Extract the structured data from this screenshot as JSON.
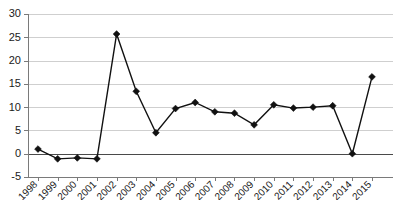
{
  "chart_data": {
    "type": "line",
    "title": "",
    "xlabel": "",
    "ylabel": "",
    "categories": [
      "1998",
      "1999",
      "2000",
      "2001",
      "2002",
      "2003",
      "2004",
      "2005",
      "2006",
      "2007",
      "2008",
      "2009",
      "2010",
      "2011",
      "2012",
      "2013",
      "2014",
      "2015"
    ],
    "values": [
      1.0,
      -1.1,
      -0.9,
      -1.1,
      25.7,
      13.4,
      4.5,
      9.7,
      11.0,
      9.0,
      8.7,
      6.2,
      10.5,
      9.8,
      10.0,
      10.3,
      0.0,
      16.5
    ],
    "series": [
      {
        "name": "series-1",
        "values": [
          1.0,
          -1.1,
          -0.9,
          -1.1,
          25.7,
          13.4,
          4.5,
          9.7,
          11.0,
          9.0,
          8.7,
          6.2,
          10.5,
          9.8,
          10.0,
          10.3,
          0.0,
          16.5
        ]
      }
    ],
    "ylim": [
      -5,
      30
    ],
    "yticks": [
      -5,
      0,
      5,
      10,
      15,
      20,
      25,
      30
    ],
    "ytick_labels": [
      "-5",
      "0",
      "5",
      "10",
      "15",
      "20",
      "25",
      "30"
    ],
    "xtick_labels": [
      "1998",
      "1999",
      "2000",
      "2001",
      "2002",
      "2003",
      "2004",
      "2005",
      "2006",
      "2007",
      "2008",
      "2009",
      "2010",
      "2011",
      "2012",
      "2013",
      "2014",
      "2015"
    ],
    "grid": true,
    "grid_axis": "y",
    "legend": false,
    "legend_position": "none",
    "marker": "diamond",
    "marker_color": "#111111",
    "line_color": "#111111",
    "gridline_color": "#cfcfcf",
    "axis_color": "#7a7a7a",
    "background_color": "#ffffff",
    "xtick_rotation": 45
  }
}
